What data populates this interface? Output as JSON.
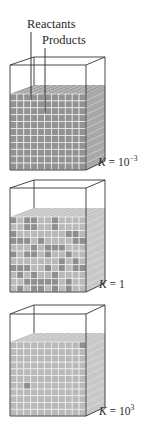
{
  "labels": {
    "reactants": "Reactants",
    "products": "Products"
  },
  "colors": {
    "background": "#ffffff",
    "outline": "#333333",
    "grid_line": "#f2f2f2",
    "reactant_cell": "#8f8f8f",
    "product_cell": "#b9b9b9",
    "side_shade": "#c8c8c8",
    "top_shade": "#b4b4b4"
  },
  "containers": [
    {
      "id": "k-small",
      "k_symbol": "K",
      "k_eq": " = ",
      "k_base": "10",
      "k_exp": "−3",
      "k_text": "K = 10−3",
      "composition": "mostly reactants",
      "geom": {
        "top_back": 57,
        "top_front": 65,
        "liq_back": 85,
        "liq_front": 94,
        "bottom": 170
      },
      "product_cells": "few",
      "reactant_fraction": 0.99
    },
    {
      "id": "k-one",
      "k_symbol": "K",
      "k_eq": " = ",
      "k_base": "1",
      "k_exp": "",
      "k_text": "K = 1",
      "composition": "mixed reactants and products",
      "geom": {
        "top_back": 180,
        "top_front": 188,
        "liq_back": 208,
        "liq_front": 217,
        "bottom": 292
      },
      "reactant_fraction": 0.4
    },
    {
      "id": "k-large",
      "k_symbol": "K",
      "k_eq": " = ",
      "k_base": "10",
      "k_exp": "3",
      "k_text": "K = 103",
      "composition": "mostly products",
      "geom": {
        "top_back": 305,
        "top_front": 314,
        "liq_back": 333,
        "liq_front": 342,
        "bottom": 416
      },
      "reactant_cells": [
        [
          10,
          0
        ],
        [
          2,
          6
        ]
      ],
      "reactant_fraction": 0.01
    }
  ]
}
